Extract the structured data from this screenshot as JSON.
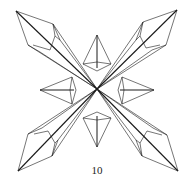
{
  "figure": {
    "label": "10",
    "stroke_color": "#1a1a1a",
    "background": "#ffffff"
  }
}
